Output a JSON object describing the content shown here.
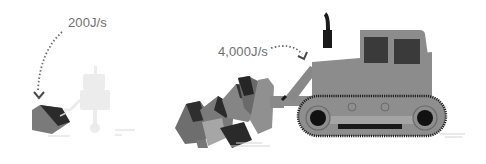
{
  "scene": {
    "left": {
      "label": "200J/s",
      "subject": "robot pushing block"
    },
    "right": {
      "label": "4,000J/s",
      "subject": "bulldozer pushing boulders"
    }
  },
  "colors": {
    "text": "#6f6f6f",
    "body": "#8c8c8c",
    "dark": "#3a3a3a",
    "black": "#1a1a1a",
    "mid": "#6e6e6e",
    "light": "#a8a8a8",
    "ghost": "#ebebeb",
    "ground": "#d4d4d4"
  }
}
